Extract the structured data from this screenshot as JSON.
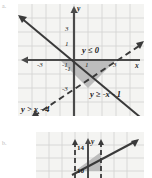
{
  "figure": {
    "kind": "math-textbook-graph-pair",
    "background_color": "#ffffff",
    "panel_color": "#f4f4f2",
    "grid_color": "#d0d0ce",
    "axis_color": "#4a4a4a",
    "shade_color": "#b9b9b9",
    "line_color": "#3a3a3a"
  },
  "top_graph": {
    "name": "system-of-inequalities-graph",
    "axis_labels": {
      "x": "x",
      "y": "y"
    },
    "x_ticks": [
      "-3",
      "-1",
      "1",
      "3"
    ],
    "y_ticks": [
      "3",
      "1",
      "-1",
      "-3"
    ],
    "x_range": [
      -4,
      4
    ],
    "y_range": [
      -4,
      4
    ],
    "inequalities": [
      {
        "id": "ineq-1",
        "text": "y ≤ 0"
      },
      {
        "id": "ineq-2",
        "text": "y ≥ -x - 1"
      },
      {
        "id": "ineq-3",
        "text": "y > x - 4"
      }
    ],
    "lines": [
      {
        "id": "line-solid-negative-slope",
        "equation": "y = -x - 1",
        "style": "solid",
        "slope": -1,
        "intercept": -1
      },
      {
        "id": "line-dashed-positive-slope",
        "equation": "y = x - 4",
        "style": "dashed",
        "slope": 1,
        "intercept": -4
      },
      {
        "id": "line-solid-x-axis",
        "equation": "y = 0",
        "style": "solid",
        "slope": 0,
        "intercept": 0
      }
    ],
    "shaded_region": {
      "id": "solution-triangle",
      "description": "triangular solution region below x-axis",
      "vertices": [
        [
          -1,
          0
        ],
        [
          3,
          0
        ],
        [
          1.5,
          -2.5
        ]
      ]
    }
  },
  "bottom_graph": {
    "name": "second-system-graph",
    "axis_labels": {
      "y": "y"
    },
    "value_labels": [
      "14",
      "10"
    ],
    "lines": [
      {
        "id": "line-dashed-left",
        "equation": "x = 10",
        "style": "dashed"
      },
      {
        "id": "line-dashed-right",
        "equation": "x = 14",
        "style": "dashed"
      },
      {
        "id": "line-solid-diagonal",
        "equation": "y = x",
        "style": "solid",
        "slope": 1
      }
    ],
    "shaded_region": {
      "id": "solution-wedge",
      "description": "shaded wedge between vertical dashed lines and diagonal"
    }
  },
  "margin_marks": {
    "top_left": "a.",
    "bottom_left": "b."
  }
}
